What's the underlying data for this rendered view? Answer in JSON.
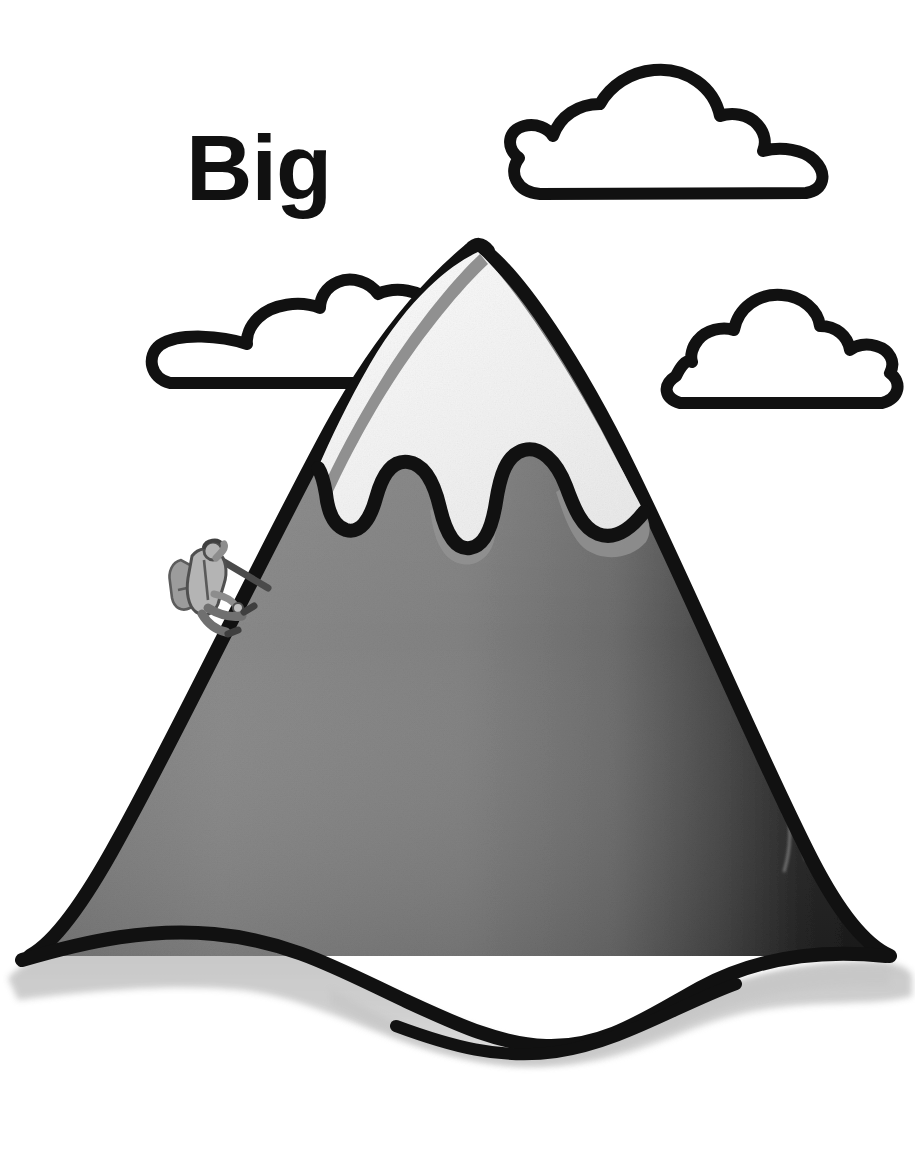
{
  "page": {
    "title": "Big",
    "background_color": "#ffffff",
    "width": 915,
    "height": 1175,
    "style": "hand-drawn black-outline flashcard illustration, grayscale marker shading"
  },
  "word_card": {
    "label": "Big",
    "text_color": "#111111",
    "position": "upper-left"
  },
  "illustration": {
    "name": "big-mountain-with-climber",
    "description": "A very large snow-capped mountain drawn with heavy black outline, with three outlined clouds in the sky and a tiny climber on the left slope, illustrating the concept 'Big'.",
    "outline_color": "#111111",
    "colors": {
      "outline": "#111111",
      "snow_fill": "#f2f2f2",
      "snow_shadow": "#8f8f8f",
      "rock_light": "#8a8a8a",
      "rock_mid": "#6f6f6f",
      "rock_dark": "#1c1c1c",
      "ground_shadow": "#c9c9c9",
      "cloud_fill": "#ffffff",
      "climber_fill": "#a8a8a8",
      "climber_dark": "#5a5a5a",
      "sky": "#ffffff"
    },
    "elements": [
      {
        "name": "cloud-top-right",
        "label": "cloud",
        "bumps": 3,
        "position": "top right"
      },
      {
        "name": "cloud-left",
        "label": "cloud",
        "bumps": 2,
        "position": "middle left, behind mountain"
      },
      {
        "name": "cloud-right",
        "label": "cloud",
        "bumps": 3,
        "position": "middle right, behind mountain"
      },
      {
        "name": "mountain",
        "label": "mountain",
        "position": "center, fills lower two-thirds"
      },
      {
        "name": "snow-cap",
        "label": "snow cap",
        "position": "mountain peak, drip-shaped lower edge"
      },
      {
        "name": "climber",
        "label": "climber with backpack and ice axe",
        "position": "left slope, upper third"
      },
      {
        "name": "ground-shadow",
        "label": "ground shadow",
        "position": "base of mountain"
      }
    ]
  }
}
